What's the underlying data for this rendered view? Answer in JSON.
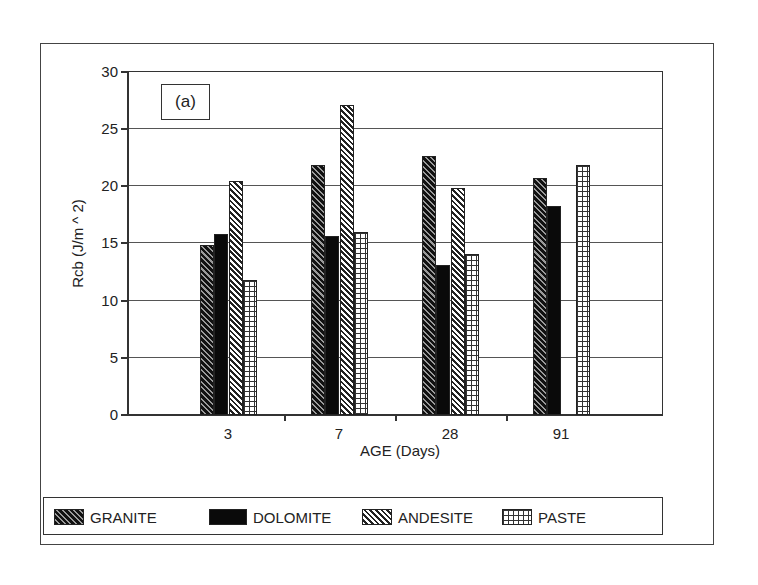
{
  "chart_data": {
    "type": "bar",
    "title": "",
    "annotation": "(a)",
    "xlabel": "AGE (Days)",
    "ylabel": "Rcb (J/m ^ 2)",
    "ylim": [
      0,
      30
    ],
    "yticks": [
      0,
      5,
      10,
      15,
      20,
      25,
      30
    ],
    "grid": true,
    "legend_position": "bottom",
    "categories": [
      "3",
      "7",
      "28",
      "91"
    ],
    "series": [
      {
        "name": "GRANITE",
        "pattern": "dense-diagonal-hatch",
        "values": [
          14.8,
          21.8,
          22.6,
          20.7
        ]
      },
      {
        "name": "DOLOMITE",
        "pattern": "solid-black",
        "values": [
          15.8,
          15.6,
          13.1,
          18.2
        ]
      },
      {
        "name": "ANDESITE",
        "pattern": "light-diagonal-hatch",
        "values": [
          20.4,
          27.0,
          19.8,
          null
        ]
      },
      {
        "name": "PASTE",
        "pattern": "grid",
        "values": [
          11.8,
          16.0,
          14.0,
          21.8
        ]
      }
    ]
  },
  "labels": {
    "annotation": "(a)",
    "xtitle": "AGE (Days)",
    "ytitle": "Rcb (J/m ^ 2)",
    "yticks": [
      "0",
      "5",
      "10",
      "15",
      "20",
      "25",
      "30"
    ],
    "xcats": [
      "3",
      "7",
      "28",
      "91"
    ],
    "legend": [
      "GRANITE",
      "DOLOMITE",
      "ANDESITE",
      "PASTE"
    ]
  }
}
